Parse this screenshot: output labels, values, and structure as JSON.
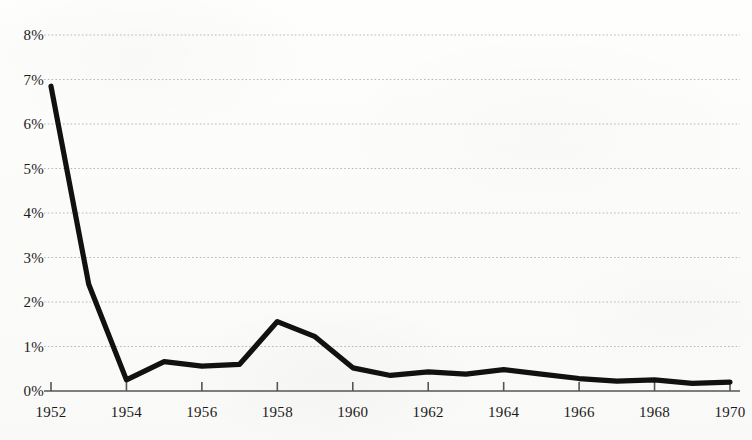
{
  "chart_data": {
    "type": "line",
    "title": "",
    "subtitle": "",
    "xlabel": "",
    "ylabel": "",
    "x": [
      1952,
      1953,
      1954,
      1955,
      1956,
      1957,
      1958,
      1959,
      1960,
      1961,
      1962,
      1963,
      1964,
      1965,
      1966,
      1967,
      1968,
      1969,
      1970
    ],
    "series": [
      {
        "name": "",
        "values": [
          6.85,
          2.4,
          0.25,
          0.66,
          0.56,
          0.6,
          1.56,
          1.22,
          0.52,
          0.35,
          0.43,
          0.38,
          0.48,
          0.38,
          0.28,
          0.22,
          0.25,
          0.17,
          0.2
        ]
      }
    ],
    "xlim": [
      1952,
      1970
    ],
    "ylim": [
      0,
      8
    ],
    "y_ticks": [
      0,
      1,
      2,
      3,
      4,
      5,
      6,
      7,
      8
    ],
    "y_tick_labels": [
      "0%",
      "1%",
      "2%",
      "3%",
      "4%",
      "5%",
      "6%",
      "7%",
      "8%"
    ],
    "x_ticks": [
      1952,
      1954,
      1956,
      1958,
      1960,
      1962,
      1964,
      1966,
      1968,
      1970
    ],
    "x_tick_labels": [
      "1952",
      "1954",
      "1956",
      "1958",
      "1960",
      "1962",
      "1964",
      "1966",
      "1968",
      "1970"
    ],
    "grid": "horizontal-dotted",
    "legend": "none",
    "line_color": "#111111",
    "grid_color": "#b8b8b8",
    "axis_color": "#555555",
    "background_color": "#fdfdfc"
  }
}
